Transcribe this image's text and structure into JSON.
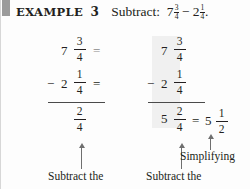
{
  "document": {
    "example_label": "EXAMPLE",
    "example_number": "3",
    "prompt_lead": "Subtract:",
    "problem": {
      "minuend": {
        "whole": "7",
        "numerator": "3",
        "denominator": "4"
      },
      "operator": "−",
      "subtrahend": {
        "whole": "2",
        "numerator": "1",
        "denominator": "4"
      },
      "terminator": "."
    }
  },
  "work_left": {
    "rows": [
      {
        "operator": "",
        "whole": "7",
        "numerator": "3",
        "denominator": "4",
        "equals": "="
      },
      {
        "operator": "−",
        "whole": "2",
        "numerator": "1",
        "denominator": "4",
        "equals": "="
      }
    ],
    "result": {
      "whole": "",
      "numerator": "2",
      "denominator": "4"
    }
  },
  "work_right": {
    "rows": [
      {
        "operator": "",
        "whole": "7",
        "numerator": "3",
        "denominator": "4"
      },
      {
        "operator": "−",
        "whole": "2",
        "numerator": "1",
        "denominator": "4"
      }
    ],
    "result": {
      "whole": "5",
      "numerator": "2",
      "denominator": "4"
    },
    "equals": "=",
    "simplified": {
      "whole": "5",
      "numerator": "1",
      "denominator": "2"
    }
  },
  "annotations": {
    "left_caption": "Subtract the",
    "middle_caption": "Subtract the",
    "simplify_caption": "Simplifying"
  }
}
